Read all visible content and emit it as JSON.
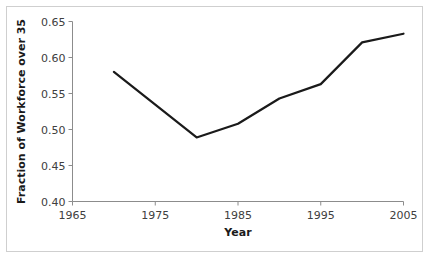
{
  "figure": {
    "background_color": "#ffffff",
    "border_color": "#cfcfcf",
    "axis_color": "#8c8c8c",
    "line_color": "#1a1a1a"
  },
  "chart_data": {
    "type": "line",
    "title": "",
    "xlabel": "Year",
    "ylabel": "Fraction of Workforce over 35",
    "xlim": [
      1965,
      2005
    ],
    "ylim": [
      0.4,
      0.65
    ],
    "xticks": [
      1965,
      1975,
      1985,
      1995,
      2005
    ],
    "xtick_labels": [
      "1965",
      "1975",
      "1985",
      "1995",
      "2005"
    ],
    "yticks": [
      0.4,
      0.45,
      0.5,
      0.55,
      0.6,
      0.65
    ],
    "ytick_labels": [
      "0.40",
      "0.45",
      "0.50",
      "0.55",
      "0.60",
      "0.65"
    ],
    "grid": false,
    "legend": null,
    "x": [
      1970,
      1980,
      1985,
      1990,
      1995,
      2000,
      2005
    ],
    "values": [
      0.58,
      0.489,
      0.508,
      0.543,
      0.563,
      0.621,
      0.633
    ],
    "series": [
      {
        "name": "Fraction of Workforce over 35",
        "x": [
          1970,
          1980,
          1985,
          1990,
          1995,
          2000,
          2005
        ],
        "values": [
          0.58,
          0.489,
          0.508,
          0.543,
          0.563,
          0.621,
          0.633
        ]
      }
    ]
  }
}
